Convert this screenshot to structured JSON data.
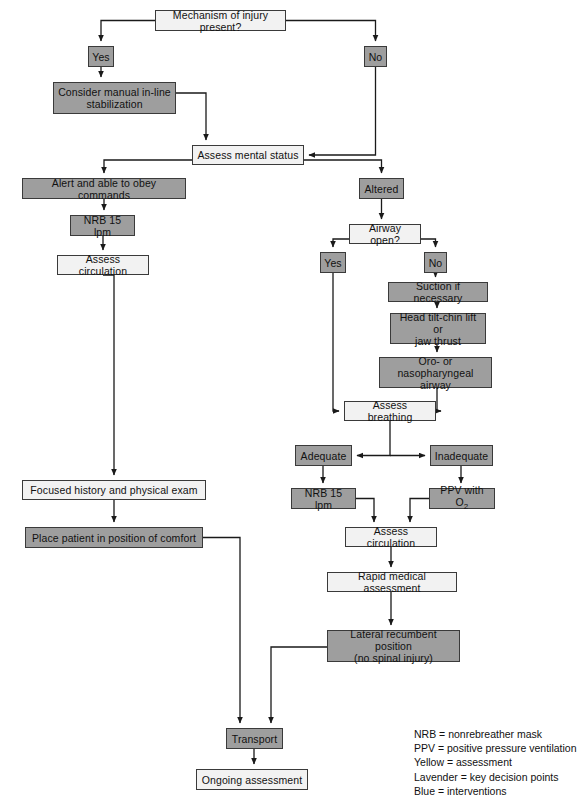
{
  "diagram": {
    "colors": {
      "shaded_fill": "#9e9e9e",
      "light_fill": "#f2f2f2",
      "border": "#3a3a3a",
      "line": "#1a1a1a",
      "text": "#111111",
      "background": "#ffffff"
    },
    "nodes": [
      {
        "id": "mechanism",
        "label": "Mechanism of injury present?",
        "style": "light",
        "x": 155,
        "y": 10,
        "w": 131,
        "h": 21
      },
      {
        "id": "yes-trauma",
        "label": "Yes",
        "style": "shaded",
        "x": 88,
        "y": 46,
        "w": 26,
        "h": 21
      },
      {
        "id": "no-trauma",
        "label": "No",
        "style": "shaded",
        "x": 364,
        "y": 46,
        "w": 23,
        "h": 21
      },
      {
        "id": "stabilization",
        "label": "Consider manual in-line\nstabilization",
        "style": "shaded",
        "x": 53,
        "y": 82,
        "w": 123,
        "h": 32
      },
      {
        "id": "mental-status",
        "label": "Assess mental status",
        "style": "light",
        "x": 192,
        "y": 145,
        "w": 112,
        "h": 20
      },
      {
        "id": "alert",
        "label": "Alert and able to obey commands",
        "style": "shaded",
        "x": 22,
        "y": 178,
        "w": 164,
        "h": 21
      },
      {
        "id": "altered",
        "label": "Altered",
        "style": "shaded",
        "x": 359,
        "y": 178,
        "w": 45,
        "h": 21
      },
      {
        "id": "nrb-alert",
        "label": "NRB 15 lpm",
        "style": "shaded",
        "x": 70,
        "y": 215,
        "w": 65,
        "h": 21
      },
      {
        "id": "airway-open",
        "label": "Airway open?",
        "style": "light",
        "x": 349,
        "y": 224,
        "w": 72,
        "h": 20
      },
      {
        "id": "assess-circ-left",
        "label": "Assess circulation",
        "style": "light",
        "x": 57,
        "y": 255,
        "w": 92,
        "h": 20
      },
      {
        "id": "yes-airway",
        "label": "Yes",
        "style": "shaded",
        "x": 320,
        "y": 252,
        "w": 26,
        "h": 21
      },
      {
        "id": "no-airway",
        "label": "No",
        "style": "shaded",
        "x": 424,
        "y": 252,
        "w": 23,
        "h": 21
      },
      {
        "id": "suction",
        "label": "Suction if necessary",
        "style": "shaded",
        "x": 388,
        "y": 282,
        "w": 100,
        "h": 20
      },
      {
        "id": "head-tilt",
        "label": "Head tilt-chin lift or\njaw thrust",
        "style": "shaded",
        "x": 390,
        "y": 313,
        "w": 96,
        "h": 31
      },
      {
        "id": "oro-naso",
        "label": "Oro- or nasopharyngeal\nairway",
        "style": "shaded",
        "x": 379,
        "y": 357,
        "w": 113,
        "h": 31
      },
      {
        "id": "assess-breathing",
        "label": "Assess breathing",
        "style": "light",
        "x": 344,
        "y": 401,
        "w": 92,
        "h": 20
      },
      {
        "id": "adequate",
        "label": "Adequate",
        "style": "shaded",
        "x": 295,
        "y": 445,
        "w": 57,
        "h": 21
      },
      {
        "id": "inadequate",
        "label": "Inadequate",
        "style": "shaded",
        "x": 430,
        "y": 445,
        "w": 63,
        "h": 21
      },
      {
        "id": "nrb-adequate",
        "label": "NRB 15 lpm",
        "style": "shaded",
        "x": 291,
        "y": 488,
        "w": 65,
        "h": 21
      },
      {
        "id": "ppv",
        "label": "PPV with O2",
        "style": "shaded",
        "x": 429,
        "y": 488,
        "w": 66,
        "h": 21,
        "subscript": {
          "before": "PPV with O",
          "sub": "2"
        }
      },
      {
        "id": "focused-history",
        "label": "Focused history and physical exam",
        "style": "light",
        "x": 22,
        "y": 480,
        "w": 184,
        "h": 20
      },
      {
        "id": "assess-circ-right",
        "label": "Assess circulation",
        "style": "light",
        "x": 345,
        "y": 527,
        "w": 92,
        "h": 20
      },
      {
        "id": "position-comfort",
        "label": "Place patient in position of comfort",
        "style": "shaded",
        "x": 25,
        "y": 527,
        "w": 178,
        "h": 21
      },
      {
        "id": "rapid-assessment",
        "label": "Rapid medical assessment",
        "style": "light",
        "x": 327,
        "y": 572,
        "w": 130,
        "h": 20
      },
      {
        "id": "lateral-recumbent",
        "label": "Lateral recumbent position\n(no spinal injury)",
        "style": "shaded",
        "x": 327,
        "y": 630,
        "w": 133,
        "h": 32
      },
      {
        "id": "transport",
        "label": "Transport",
        "style": "shaded",
        "x": 226,
        "y": 728,
        "w": 57,
        "h": 21
      },
      {
        "id": "ongoing",
        "label": "Ongoing assessment",
        "style": "light",
        "x": 196,
        "y": 769,
        "w": 112,
        "h": 21
      }
    ],
    "legend": {
      "x": 414,
      "y": 727,
      "lines": [
        "NRB = nonrebreather mask",
        "PPV = positive pressure ventilation",
        "Yellow = assessment",
        "Lavender = key decision points",
        "Blue = interventions"
      ]
    },
    "edges": [
      {
        "id": "mechanism-to-yes",
        "from": "mechanism",
        "to": "yes-trauma"
      },
      {
        "id": "mechanism-to-no",
        "from": "mechanism",
        "to": "no-trauma"
      },
      {
        "id": "yes-to-stabilization",
        "from": "yes-trauma",
        "to": "stabilization"
      },
      {
        "id": "stabilization-to-mental",
        "from": "stabilization",
        "to": "mental-status"
      },
      {
        "id": "no-to-mental",
        "from": "no-trauma",
        "to": "mental-status"
      },
      {
        "id": "mental-to-alert",
        "from": "mental-status",
        "to": "alert"
      },
      {
        "id": "mental-to-altered",
        "from": "mental-status",
        "to": "altered"
      },
      {
        "id": "alert-to-nrb",
        "from": "alert",
        "to": "nrb-alert"
      },
      {
        "id": "nrb-to-circulation",
        "from": "nrb-alert",
        "to": "assess-circ-left"
      },
      {
        "id": "circulation-to-focused",
        "from": "assess-circ-left",
        "to": "focused-history"
      },
      {
        "id": "focused-to-comfort",
        "from": "focused-history",
        "to": "position-comfort"
      },
      {
        "id": "comfort-to-transport",
        "from": "position-comfort",
        "to": "transport"
      },
      {
        "id": "altered-to-airway",
        "from": "altered",
        "to": "airway-open"
      },
      {
        "id": "airway-to-yes",
        "from": "airway-open",
        "to": "yes-airway"
      },
      {
        "id": "airway-to-no",
        "from": "airway-open",
        "to": "no-airway"
      },
      {
        "id": "no-to-suction",
        "from": "no-airway",
        "to": "suction"
      },
      {
        "id": "suction-to-headtilt",
        "from": "suction",
        "to": "head-tilt"
      },
      {
        "id": "headtilt-to-oronaso",
        "from": "head-tilt",
        "to": "oro-naso"
      },
      {
        "id": "oronaso-to-breathing",
        "from": "oro-naso",
        "to": "assess-breathing"
      },
      {
        "id": "yesairway-to-breathing",
        "from": "yes-airway",
        "to": "assess-breathing"
      },
      {
        "id": "breathing-to-adequate",
        "from": "assess-breathing",
        "to": "adequate"
      },
      {
        "id": "breathing-to-inadequate",
        "from": "assess-breathing",
        "to": "inadequate"
      },
      {
        "id": "adequate-to-nrb",
        "from": "adequate",
        "to": "nrb-adequate"
      },
      {
        "id": "inadequate-to-ppv",
        "from": "inadequate",
        "to": "ppv"
      },
      {
        "id": "nrb2-to-circulation",
        "from": "nrb-adequate",
        "to": "assess-circ-right"
      },
      {
        "id": "ppv-to-circulation",
        "from": "ppv",
        "to": "assess-circ-right"
      },
      {
        "id": "circulation2-to-rapid",
        "from": "assess-circ-right",
        "to": "rapid-assessment"
      },
      {
        "id": "rapid-to-lateral",
        "from": "rapid-assessment",
        "to": "lateral-recumbent"
      },
      {
        "id": "lateral-to-transport",
        "from": "lateral-recumbent",
        "to": "transport"
      },
      {
        "id": "transport-to-ongoing",
        "from": "transport",
        "to": "ongoing"
      }
    ]
  }
}
